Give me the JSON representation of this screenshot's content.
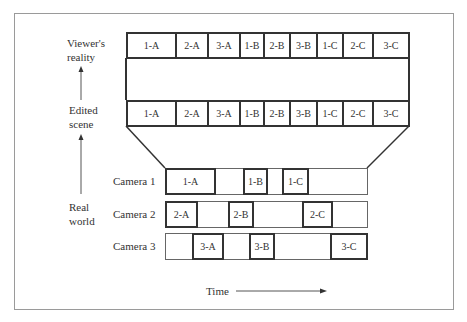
{
  "labels": {
    "viewers_reality": [
      "Viewer's",
      "reality"
    ],
    "edited_scene": [
      "Edited",
      "scene"
    ],
    "real_world": [
      "Real",
      "world"
    ],
    "time": "Time"
  },
  "viewer_strip": [
    "1-A",
    "2-A",
    "3-A",
    "1-B",
    "2-B",
    "3-B",
    "1-C",
    "2-C",
    "3-C"
  ],
  "edited_strip": [
    "1-A",
    "2-A",
    "3-A",
    "1-B",
    "2-B",
    "3-B",
    "1-C",
    "2-C",
    "3-C"
  ],
  "strip_edges": [
    126,
    175,
    207,
    239,
    263,
    289,
    316,
    342,
    372,
    409
  ],
  "cameras": [
    {
      "name": "Camera 1",
      "shots": [
        {
          "label": "1-A",
          "x1": 165,
          "x2": 215
        },
        {
          "label": "1-B",
          "x1": 243,
          "x2": 267
        },
        {
          "label": "1-C",
          "x1": 282,
          "x2": 308
        }
      ]
    },
    {
      "name": "Camera 2",
      "shots": [
        {
          "label": "2-A",
          "x1": 165,
          "x2": 197
        },
        {
          "label": "2-B",
          "x1": 228,
          "x2": 253
        },
        {
          "label": "2-C",
          "x1": 302,
          "x2": 332
        }
      ]
    },
    {
      "name": "Camera 3",
      "shots": [
        {
          "label": "3-A",
          "x1": 192,
          "x2": 223
        },
        {
          "label": "3-B",
          "x1": 249,
          "x2": 274
        },
        {
          "label": "3-C",
          "x1": 330,
          "x2": 367
        }
      ]
    }
  ]
}
